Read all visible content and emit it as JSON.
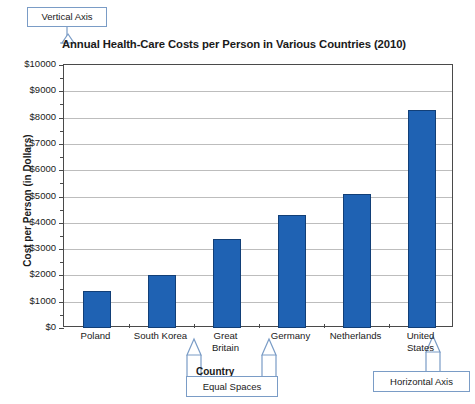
{
  "chart_data": {
    "type": "bar",
    "title": "Annual Health-Care Costs per Person in Various Countries (2010)",
    "xlabel": "Country",
    "ylabel": "Cost per Person (in Dollars)",
    "categories": [
      "Poland",
      "South Korea",
      "Great\nBritain",
      "Germany",
      "Netherlands",
      "United\nStates"
    ],
    "values": [
      1400,
      2000,
      3400,
      4300,
      5100,
      8300
    ],
    "ylim": [
      0,
      10000
    ],
    "ytick_labels": [
      "$0",
      "$1000",
      "$2000",
      "$3000",
      "$4000",
      "$5000",
      "$6000",
      "$7000",
      "$8000",
      "$9000",
      "$10000"
    ],
    "ytick_values": [
      0,
      1000,
      2000,
      3000,
      4000,
      5000,
      6000,
      7000,
      8000,
      9000,
      10000
    ],
    "minor_tick_step": 500,
    "grid": true,
    "legend": "none",
    "bar_color": "#1f62b3",
    "bar_border_color": "#123f77",
    "gridline_color": "#bdbdbd",
    "axis_color": "#4a4a4a"
  },
  "annotations": {
    "vertical_axis": "Vertical Axis",
    "horizontal_axis": "Horizontal Axis",
    "equal_spaces": "Equal Spaces",
    "country": "Country",
    "callout_border_color": "#7a9cc6"
  }
}
